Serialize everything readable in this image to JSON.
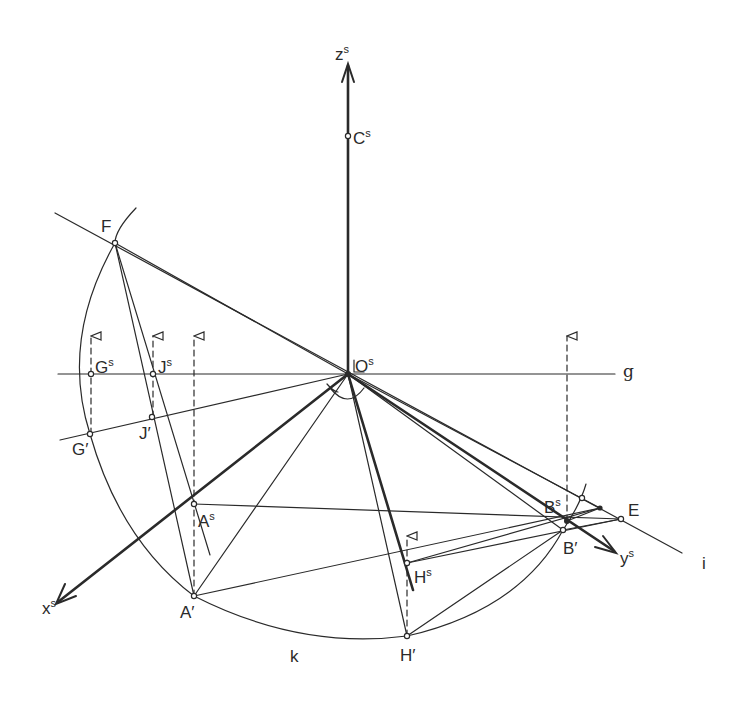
{
  "diagram": {
    "type": "descriptive-geometry-construction",
    "stroke_color": "#2a2a2a",
    "background": "#ffffff",
    "labels": {
      "zs": {
        "base": "z",
        "sup": "s"
      },
      "cs": {
        "base": "C",
        "sup": "s"
      },
      "f": {
        "base": "F",
        "sup": ""
      },
      "gs": {
        "base": "G",
        "sup": "s"
      },
      "js": {
        "base": "J",
        "sup": "s"
      },
      "os": {
        "base": "O",
        "sup": "s"
      },
      "g": {
        "base": "g",
        "sup": ""
      },
      "gp": {
        "base": "G′",
        "sup": ""
      },
      "jp": {
        "base": "J′",
        "sup": ""
      },
      "as": {
        "base": "A",
        "sup": "s"
      },
      "ap": {
        "base": "A′",
        "sup": ""
      },
      "xs": {
        "base": "x",
        "sup": "s"
      },
      "hs": {
        "base": "H",
        "sup": "s"
      },
      "hp": {
        "base": "H′",
        "sup": ""
      },
      "k": {
        "base": "k",
        "sup": ""
      },
      "bs": {
        "base": "B",
        "sup": "s"
      },
      "bp": {
        "base": "B′",
        "sup": ""
      },
      "e": {
        "base": "E",
        "sup": ""
      },
      "ys": {
        "base": "y",
        "sup": "s"
      },
      "i": {
        "base": "i",
        "sup": ""
      }
    },
    "points": {
      "O": [
        348,
        374
      ],
      "C": [
        348,
        136
      ],
      "F": [
        115,
        243
      ],
      "Gs": [
        91,
        374
      ],
      "Js": [
        153,
        374
      ],
      "Gp": [
        90,
        434
      ],
      "Jp": [
        152,
        417
      ],
      "As": [
        194,
        504
      ],
      "Ap": [
        194,
        596
      ],
      "Hs": [
        407,
        563
      ],
      "Hp": [
        407,
        636
      ],
      "Bs": [
        567,
        521
      ],
      "Bp": [
        563,
        530
      ],
      "E": [
        621,
        519
      ]
    }
  }
}
